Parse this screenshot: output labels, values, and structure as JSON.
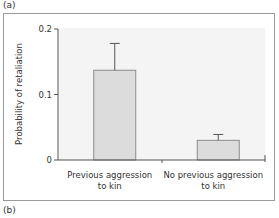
{
  "panels": {
    "top_label": "(a)",
    "bottom_label": "(b)"
  },
  "colors": {
    "plot_background": "#f4f4f4",
    "bar_fill": "#dcdcdc",
    "bar_stroke": "#8c8c8c",
    "axis": "#555555",
    "frame": "#9a9a9a"
  },
  "chart_data": {
    "type": "bar",
    "title": "",
    "xlabel": "",
    "ylabel": "Probability of retaliation",
    "ylim": [
      0,
      0.2
    ],
    "yticks": [
      0,
      0.1,
      0.2
    ],
    "ytick_labels": [
      "0",
      "0.1",
      "0.2"
    ],
    "categories": [
      "Previous aggression to kin",
      "No previous aggression to kin"
    ],
    "category_lines": [
      [
        "Previous aggression",
        "to kin"
      ],
      [
        "No previous aggression",
        "to kin"
      ]
    ],
    "values": [
      0.137,
      0.03
    ],
    "error_upper": [
      0.178,
      0.039
    ],
    "grid": false,
    "legend": null
  }
}
